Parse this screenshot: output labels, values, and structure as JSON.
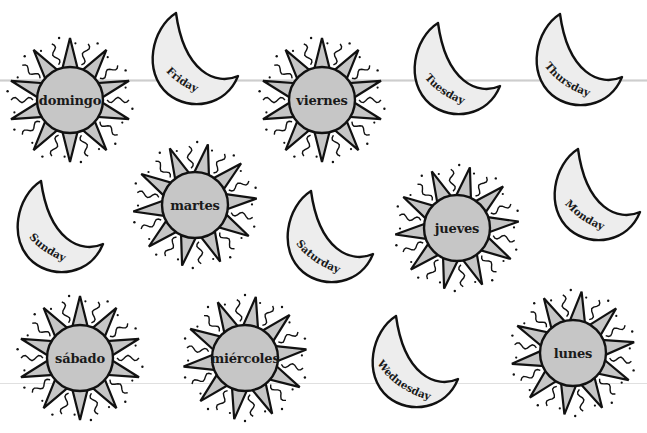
{
  "worksheet": {
    "colors": {
      "sun_disk": "#c6c6c6",
      "sun_ray": "#c6c6c6",
      "moon_fill": "#ededed",
      "outline": "#111111"
    },
    "suns": [
      {
        "label": "domingo",
        "x": 70,
        "y": 100,
        "rot": 0
      },
      {
        "label": "viernes",
        "x": 322,
        "y": 100,
        "rot": 0
      },
      {
        "label": "martes",
        "x": 195,
        "y": 205,
        "rot": 12
      },
      {
        "label": "jueves",
        "x": 457,
        "y": 228,
        "rot": 12
      },
      {
        "label": "sábado",
        "x": 80,
        "y": 358,
        "rot": 0
      },
      {
        "label": "miércoles",
        "x": 245,
        "y": 358,
        "rot": 10
      },
      {
        "label": "lunes",
        "x": 573,
        "y": 353,
        "rot": 8
      }
    ],
    "moons": [
      {
        "label": "Friday",
        "x": 146,
        "y": 10
      },
      {
        "label": "Tuesday",
        "x": 408,
        "y": 20
      },
      {
        "label": "Thursday",
        "x": 530,
        "y": 11
      },
      {
        "label": "Sunday",
        "x": 11,
        "y": 178
      },
      {
        "label": "Saturday",
        "x": 281,
        "y": 188
      },
      {
        "label": "Monday",
        "x": 548,
        "y": 146
      },
      {
        "label": "Wednesday",
        "x": 366,
        "y": 313
      }
    ]
  }
}
